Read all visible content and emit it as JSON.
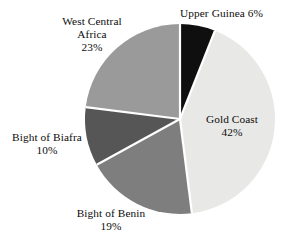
{
  "chart_data": {
    "type": "pie",
    "title": "",
    "subtitle": "",
    "xlabel": "",
    "ylabel": "",
    "legend_position": "none",
    "grid": false,
    "labels_on_slices": true,
    "start_angle_deg": 0,
    "direction": "clockwise",
    "total_percent": 100,
    "categories": [
      "Upper Guinea",
      "Gold Coast",
      "Bight of Benin",
      "Bight of Biafra",
      "West Central Africa"
    ],
    "values": [
      6,
      42,
      19,
      10,
      23
    ],
    "value_unit": "%",
    "slices": [
      {
        "name": "Upper Guinea",
        "value": 6,
        "percent_text": "6%",
        "label_text": "Upper Guinea 6%",
        "label_lines": [
          "Upper Guinea 6%"
        ],
        "color": "#100f10",
        "start_angle_deg": 0,
        "end_angle_deg": 21.6,
        "label_placement": "outside-top-right"
      },
      {
        "name": "Gold Coast",
        "value": 42,
        "percent_text": "42%",
        "label_text": "Gold Coast 42%",
        "label_lines": [
          "Gold Coast",
          "42%"
        ],
        "color": "#e8e8e6",
        "start_angle_deg": 21.6,
        "end_angle_deg": 172.8,
        "label_placement": "inside-right"
      },
      {
        "name": "Bight of Benin",
        "value": 19,
        "percent_text": "19%",
        "label_text": "Bight of Benin 19%",
        "label_lines": [
          "Bight of Benin",
          "19%"
        ],
        "color": "#7e7e7e",
        "start_angle_deg": 172.8,
        "end_angle_deg": 241.2,
        "label_placement": "outside-bottom"
      },
      {
        "name": "Bight of Biafra",
        "value": 10,
        "percent_text": "10%",
        "label_text": "Bight of Biafra 10%",
        "label_lines": [
          "Bight of Biafra",
          "10%"
        ],
        "color": "#565656",
        "start_angle_deg": 241.2,
        "end_angle_deg": 277.2,
        "label_placement": "outside-left"
      },
      {
        "name": "West Central Africa",
        "value": 23,
        "percent_text": "23%",
        "label_text": "West Central Africa 23%",
        "label_lines": [
          "West Central",
          "Africa",
          "23%"
        ],
        "color": "#9a9a9a",
        "start_angle_deg": 277.2,
        "end_angle_deg": 360,
        "label_placement": "outside-top-left"
      }
    ],
    "geometry": {
      "center_x": 180,
      "center_y": 119,
      "radius": 95,
      "separator_color": "#ffffff",
      "separator_width": 2.2
    },
    "background_color": "#ffffff",
    "text_color": "#0d0d0d"
  },
  "labels": {
    "upper_guinea": {
      "line1": "Upper Guinea 6%"
    },
    "west_central_africa": {
      "line1": "West Central",
      "line2": "Africa",
      "line3": "23%"
    },
    "gold_coast": {
      "line1": "Gold Coast",
      "line2": "42%"
    },
    "bight_of_biafra": {
      "line1": "Bight of Biafra",
      "line2": "10%"
    },
    "bight_of_benin": {
      "line1": "Bight of Benin",
      "line2": "19%"
    }
  }
}
